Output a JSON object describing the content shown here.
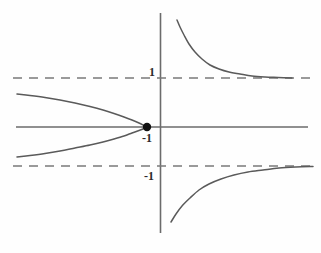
{
  "figure": {
    "width": 321,
    "height": 253,
    "background_color": "#fefefe",
    "line_color": "#5a5a5a",
    "axis_color": "#6b6b6b",
    "dash_color": "#7a7a7a",
    "point_color": "#111111",
    "label_color": "#2a2a2a"
  },
  "labels": {
    "upper_asymptote": "1",
    "origin_point": "-1",
    "lower_asymptote": "-1"
  },
  "chart_data": {
    "type": "line",
    "title": "",
    "xlabel": "",
    "ylabel": "",
    "grid": false,
    "legend": null,
    "axes": {
      "x_axis": {
        "pixel_y": 127,
        "pixel_x_start": 16,
        "pixel_x_end": 308,
        "value": 0
      },
      "y_axis": {
        "pixel_x": 160,
        "pixel_y_start": 13,
        "pixel_y_end": 233,
        "value": 0
      },
      "origin_pixel": [
        160,
        127
      ],
      "x_unit_pixels": 13,
      "y_unit_pixels": 49,
      "xlim": [
        -11.1,
        12.4
      ],
      "ylim": [
        -2.16,
        2.33
      ]
    },
    "asymptotes": [
      {
        "name": "upper-asymptote",
        "orientation": "horizontal",
        "value": 1,
        "label": "1",
        "style": "dashed",
        "pixel_y": 78,
        "pixel_x_start": 13,
        "pixel_x_end": 310
      },
      {
        "name": "lower-asymptote",
        "orientation": "horizontal",
        "value": -1,
        "label": "-1",
        "style": "dashed",
        "pixel_y": 166,
        "pixel_x_start": 13,
        "pixel_x_end": 313
      }
    ],
    "marked_points": [
      {
        "name": "vertex-point",
        "label": "-1",
        "x": -1,
        "y": 0,
        "pixel": [
          147,
          127
        ],
        "radius_px": 4.2
      }
    ],
    "series": [
      {
        "name": "upper-right-branch",
        "style": "solid",
        "description": "decreasing convex curve in the first quadrant approaching y=1 from above",
        "points_pixel": [
          [
            177,
            20
          ],
          [
            180,
            27
          ],
          [
            184,
            35
          ],
          [
            189,
            44
          ],
          [
            195,
            52
          ],
          [
            202,
            59
          ],
          [
            210,
            65
          ],
          [
            219,
            69
          ],
          [
            229,
            72
          ],
          [
            240,
            74
          ],
          [
            252,
            76
          ],
          [
            265,
            77
          ],
          [
            278,
            77.5
          ],
          [
            292,
            78
          ]
        ]
      },
      {
        "name": "lower-right-branch",
        "style": "solid",
        "description": "increasing concave curve in the fourth quadrant approaching y=-1 from below",
        "points_pixel": [
          [
            171,
            222
          ],
          [
            176,
            214
          ],
          [
            182,
            206
          ],
          [
            190,
            198
          ],
          [
            199,
            190
          ],
          [
            209,
            184
          ],
          [
            221,
            179
          ],
          [
            234,
            175
          ],
          [
            248,
            172
          ],
          [
            263,
            170
          ],
          [
            279,
            168
          ],
          [
            296,
            167
          ],
          [
            313,
            166.5
          ]
        ]
      },
      {
        "name": "left-parabola-upper-branch",
        "style": "solid",
        "description": "upper half of a leftward-opening parabola with vertex at (-1, 0)",
        "points_pixel": [
          [
            17,
            94
          ],
          [
            30,
            95.5
          ],
          [
            45,
            97.5
          ],
          [
            60,
            100
          ],
          [
            75,
            103
          ],
          [
            90,
            106.5
          ],
          [
            103,
            110
          ],
          [
            114,
            113.5
          ],
          [
            124,
            117
          ],
          [
            132,
            120
          ],
          [
            139,
            123
          ],
          [
            144,
            125.5
          ],
          [
            147,
            127
          ]
        ]
      },
      {
        "name": "left-parabola-lower-branch",
        "style": "solid",
        "description": "lower half of a leftward-opening parabola with vertex at (-1, 0)",
        "points_pixel": [
          [
            17,
            157
          ],
          [
            30,
            155.5
          ],
          [
            45,
            153.5
          ],
          [
            60,
            151
          ],
          [
            75,
            148
          ],
          [
            90,
            145
          ],
          [
            103,
            142
          ],
          [
            114,
            139
          ],
          [
            124,
            136
          ],
          [
            132,
            133
          ],
          [
            139,
            130.5
          ],
          [
            144,
            128.5
          ],
          [
            147,
            127
          ]
        ]
      }
    ]
  }
}
